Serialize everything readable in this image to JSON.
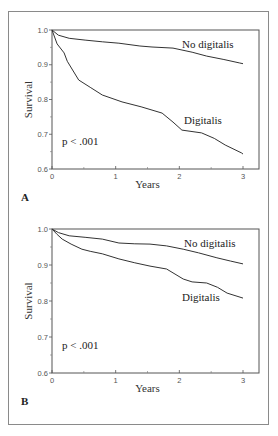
{
  "chart_data": [
    {
      "type": "line",
      "panel_label": "A",
      "xlabel": "Years",
      "ylabel": "Survival",
      "xlim": [
        0,
        3
      ],
      "ylim": [
        0.6,
        1.0
      ],
      "xticks": [
        0,
        1,
        2,
        3
      ],
      "xtick_labels": [
        "0",
        "1",
        "2",
        "3"
      ],
      "yticks": [
        0.6,
        0.7,
        0.8,
        0.9,
        1.0
      ],
      "ytick_labels": [
        "0.6",
        "0.7",
        "0.8",
        "0.9",
        "1.0"
      ],
      "grid": false,
      "annotation": "p < .001",
      "series": [
        {
          "name": "No digitalis",
          "x": [
            0,
            0.1,
            0.27,
            0.52,
            0.79,
            1.05,
            1.38,
            1.57,
            1.9,
            2.2,
            2.43,
            2.7,
            2.95,
            3.0
          ],
          "y": [
            1.0,
            0.985,
            0.976,
            0.971,
            0.966,
            0.962,
            0.954,
            0.951,
            0.948,
            0.936,
            0.925,
            0.915,
            0.905,
            0.903
          ]
        },
        {
          "name": "Digitalis",
          "x": [
            0,
            0.08,
            0.19,
            0.24,
            0.42,
            0.6,
            0.79,
            1.1,
            1.4,
            1.73,
            1.9,
            2.04,
            2.35,
            2.55,
            2.72,
            2.98,
            3.0
          ],
          "y": [
            1.0,
            0.96,
            0.934,
            0.91,
            0.856,
            0.835,
            0.813,
            0.793,
            0.779,
            0.761,
            0.735,
            0.712,
            0.704,
            0.688,
            0.669,
            0.646,
            0.643
          ]
        }
      ]
    },
    {
      "type": "line",
      "panel_label": "B",
      "xlabel": "Years",
      "ylabel": "Survival",
      "xlim": [
        0,
        3
      ],
      "ylim": [
        0.6,
        1.0
      ],
      "xticks": [
        0,
        1,
        2,
        3
      ],
      "xtick_labels": [
        "0",
        "1",
        "2",
        "3"
      ],
      "yticks": [
        0.6,
        0.7,
        0.8,
        0.9,
        1.0
      ],
      "ytick_labels": [
        "0.6",
        "0.7",
        "0.8",
        "0.9",
        "1.0"
      ],
      "grid": false,
      "annotation": "p < .001",
      "series": [
        {
          "name": "No digitalis",
          "x": [
            0,
            0.1,
            0.27,
            0.52,
            0.79,
            1.05,
            1.3,
            1.54,
            1.8,
            2.06,
            2.3,
            2.59,
            2.8,
            3.0
          ],
          "y": [
            1.0,
            0.99,
            0.981,
            0.977,
            0.972,
            0.961,
            0.959,
            0.958,
            0.953,
            0.944,
            0.934,
            0.92,
            0.911,
            0.903
          ]
        },
        {
          "name": "Digitalis",
          "x": [
            0,
            0.08,
            0.16,
            0.3,
            0.47,
            0.6,
            0.79,
            1.05,
            1.3,
            1.54,
            1.8,
            2.06,
            2.2,
            2.43,
            2.6,
            2.75,
            3.0
          ],
          "y": [
            1.0,
            0.985,
            0.972,
            0.958,
            0.944,
            0.938,
            0.931,
            0.917,
            0.906,
            0.897,
            0.889,
            0.861,
            0.853,
            0.85,
            0.838,
            0.822,
            0.808
          ]
        }
      ]
    }
  ]
}
